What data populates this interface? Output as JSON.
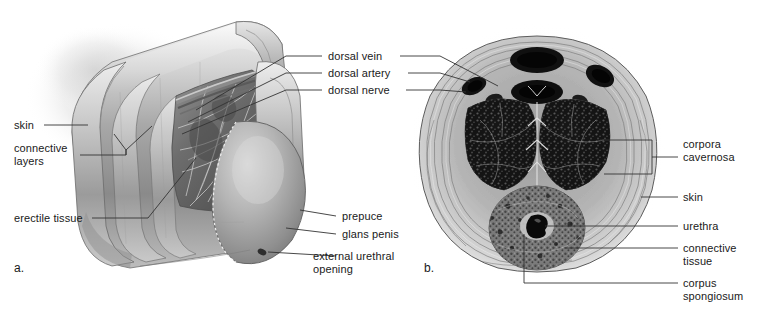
{
  "figure": {
    "background_color": "#ffffff",
    "line_color": "#333333",
    "text_color": "#1a1a1a",
    "panels": [
      {
        "letter": "a.",
        "kind": "cutaway-3d-illustration"
      },
      {
        "letter": "b.",
        "kind": "cross-section-micrograph"
      }
    ]
  },
  "labels": {
    "left": [
      {
        "id": "skin-a",
        "text": "skin"
      },
      {
        "id": "connective-layers",
        "text": "connective\nlayers"
      },
      {
        "id": "erectile-tissue",
        "text": "erectile tissue"
      }
    ],
    "center": [
      {
        "id": "dorsal-vein",
        "text": "dorsal vein"
      },
      {
        "id": "dorsal-artery",
        "text": "dorsal artery"
      },
      {
        "id": "dorsal-nerve",
        "text": "dorsal nerve"
      }
    ],
    "center_lower": [
      {
        "id": "prepuce",
        "text": "prepuce"
      },
      {
        "id": "glans-penis",
        "text": "glans penis"
      },
      {
        "id": "external-urethral-opening",
        "text": "external urethral\nopening"
      }
    ],
    "right": [
      {
        "id": "corpora-cavernosa",
        "text": "corpora\ncavernosa"
      },
      {
        "id": "skin-b",
        "text": "skin"
      },
      {
        "id": "urethra",
        "text": "urethra"
      },
      {
        "id": "connective-tissue",
        "text": "connective\ntissue"
      },
      {
        "id": "corpus-spongiosum",
        "text": "corpus\nspongiosum"
      }
    ]
  }
}
